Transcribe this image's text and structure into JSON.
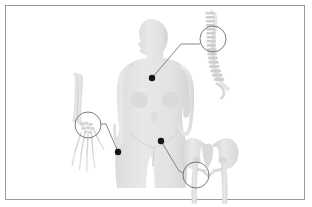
{
  "figure": {
    "background_color": "#ffffff",
    "border_color": "#9a9a9a",
    "silhouette_color": "#e4e4e4",
    "silhouette_shade_color": "#dadada",
    "bone_color": "#e2e2e2",
    "bone_shade_color": "#d2d2d2",
    "marker_color": "#141414",
    "leader_line_color": "#666666",
    "callout_circle_color": "#555555"
  },
  "subject": {
    "name": "female-body-silhouette",
    "description": "Light gray front-facing female torso silhouette, head turned to the left, cropped at mid-thigh",
    "head_direction": "left"
  },
  "markers": [
    {
      "id": "marker-spine",
      "label": "spine-fracture-site",
      "x": 152,
      "y": 78,
      "radius": 3.2
    },
    {
      "id": "marker-wrist",
      "label": "wrist-fracture-site",
      "x": 118,
      "y": 152,
      "radius": 3.2
    },
    {
      "id": "marker-hip",
      "label": "hip-fracture-site",
      "x": 161,
      "y": 141,
      "radius": 3.2
    }
  ],
  "callouts": [
    {
      "id": "callout-spine",
      "label": "vertebral-column-callout",
      "region": "spine",
      "circle": {
        "cx": 213,
        "cy": 39,
        "r": 13
      },
      "leader": [
        [
          152,
          78
        ],
        [
          181,
          44
        ],
        [
          200,
          44
        ]
      ]
    },
    {
      "id": "callout-wrist",
      "label": "wrist-carpal-callout",
      "region": "wrist",
      "circle": {
        "cx": 88,
        "cy": 125,
        "r": 13
      },
      "leader": [
        [
          118,
          152
        ],
        [
          106,
          124
        ],
        [
          101,
          124
        ]
      ]
    },
    {
      "id": "callout-hip",
      "label": "hip-femoral-neck-callout",
      "region": "hip",
      "circle": {
        "cx": 196,
        "cy": 175,
        "r": 13
      },
      "leader": [
        [
          161,
          141
        ],
        [
          179,
          171
        ],
        [
          183,
          173
        ]
      ]
    }
  ],
  "bone_illustrations": [
    {
      "id": "spine-illustration",
      "label": "vertebral-column",
      "position": "right-upper",
      "vertebra_count": 17
    },
    {
      "id": "forearm-illustration",
      "label": "forearm-and-hand-bones",
      "position": "left-middle",
      "bones": [
        "radius",
        "ulna",
        "carpals",
        "metacarpals",
        "phalanges"
      ]
    },
    {
      "id": "pelvis-illustration",
      "label": "pelvis-and-femurs",
      "position": "right-lower",
      "bones": [
        "ilium",
        "sacrum",
        "pubis",
        "femur-left",
        "femur-right"
      ]
    }
  ]
}
